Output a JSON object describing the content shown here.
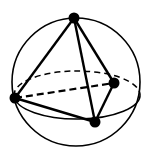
{
  "diagram": {
    "colors": {
      "stroke": "#000000",
      "background": "#ffffff"
    },
    "sphere": {
      "cx": 76,
      "cy": 82,
      "r": 64
    },
    "equator": {
      "cx": 77,
      "cy": 95,
      "rx": 63,
      "ry": 24
    },
    "vertices": [
      {
        "name": "top",
        "x": 74,
        "y": 18
      },
      {
        "name": "left",
        "x": 15,
        "y": 98
      },
      {
        "name": "right",
        "x": 114,
        "y": 83
      },
      {
        "name": "bottom",
        "x": 95,
        "y": 122
      }
    ],
    "edges": [
      {
        "from": "top",
        "to": "left",
        "style": "solid"
      },
      {
        "from": "top",
        "to": "right",
        "style": "solid"
      },
      {
        "from": "top",
        "to": "bottom",
        "style": "solid"
      },
      {
        "from": "left",
        "to": "bottom",
        "style": "solid"
      },
      {
        "from": "right",
        "to": "bottom",
        "style": "solid"
      },
      {
        "from": "left",
        "to": "right",
        "style": "dashed"
      }
    ]
  }
}
